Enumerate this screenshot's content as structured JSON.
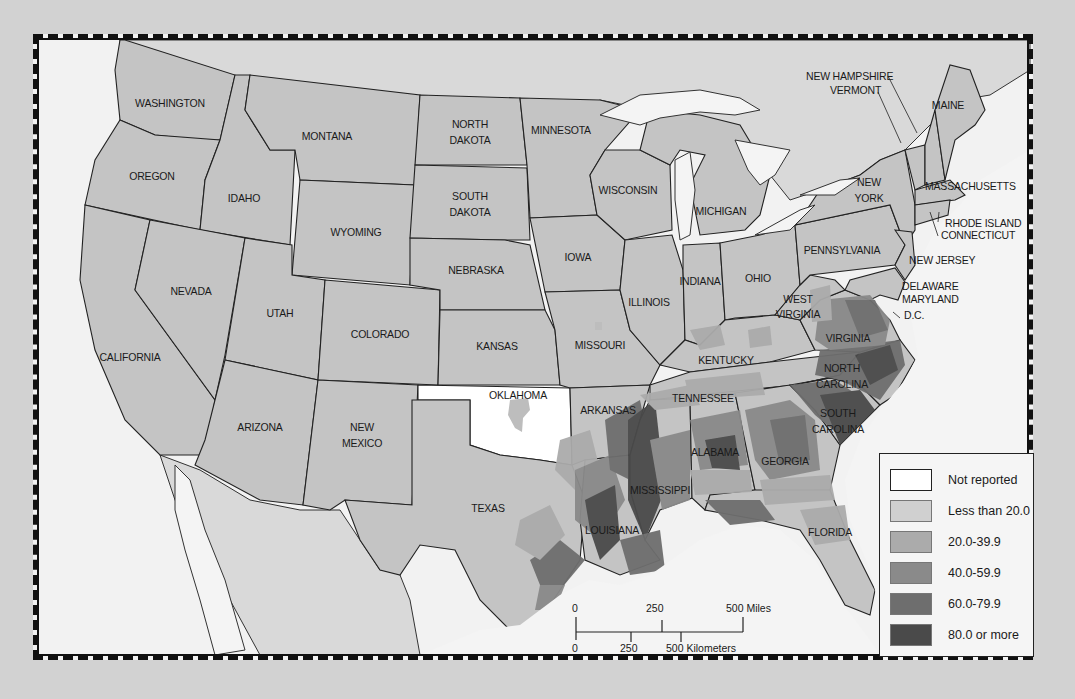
{
  "map": {
    "title": "",
    "states": {
      "washington": "WASHINGTON",
      "oregon": "OREGON",
      "california": "CALIFORNIA",
      "idaho": "IDAHO",
      "nevada": "NEVADA",
      "montana": "MONTANA",
      "wyoming": "WYOMING",
      "utah": "UTAH",
      "arizona": "ARIZONA",
      "colorado": "COLORADO",
      "new_mexico_1": "NEW",
      "new_mexico_2": "MEXICO",
      "north_dakota_1": "NORTH",
      "north_dakota_2": "DAKOTA",
      "south_dakota_1": "SOUTH",
      "south_dakota_2": "DAKOTA",
      "nebraska": "NEBRASKA",
      "kansas": "KANSAS",
      "oklahoma": "OKLAHOMA",
      "texas": "TEXAS",
      "minnesota": "MINNESOTA",
      "iowa": "IOWA",
      "missouri": "MISSOURI",
      "arkansas": "ARKANSAS",
      "louisiana": "LOUISIANA",
      "wisconsin": "WISCONSIN",
      "illinois": "ILLINOIS",
      "michigan": "MICHIGAN",
      "indiana": "INDIANA",
      "ohio": "OHIO",
      "kentucky": "KENTUCKY",
      "tennessee": "TENNESSEE",
      "mississippi": "MISSISSIPPI",
      "alabama": "ALABAMA",
      "georgia": "GEORGIA",
      "florida": "FLORIDA",
      "south_carolina_1": "SOUTH",
      "south_carolina_2": "CAROLINA",
      "north_carolina_1": "NORTH",
      "north_carolina_2": "CAROLINA",
      "virginia": "VIRGINIA",
      "west_virginia_1": "WEST",
      "west_virginia_2": "VIRGINIA",
      "pennsylvania": "PENNSYLVANIA",
      "new_york_1": "NEW",
      "new_york_2": "YORK",
      "maine": "MAINE",
      "new_hampshire": "NEW HAMPSHIRE",
      "vermont": "VERMONT",
      "massachusetts": "MASSACHUSETTS",
      "rhode_island": "RHODE ISLAND",
      "connecticut": "CONNECTICUT",
      "new_jersey": "NEW JERSEY",
      "delaware": "DELAWARE",
      "maryland": "MARYLAND",
      "dc": "D.C."
    },
    "not_reported_states": [
      "OKLAHOMA"
    ]
  },
  "legend": {
    "items": [
      {
        "label": "Not reported",
        "color": "#ffffff"
      },
      {
        "label": "Less than 20.0",
        "color": "#d0d0d0"
      },
      {
        "label": "20.0-39.9",
        "color": "#ababab"
      },
      {
        "label": "40.0-59.9",
        "color": "#8a8a8a"
      },
      {
        "label": "60.0-79.9",
        "color": "#6e6e6e"
      },
      {
        "label": "80.0 or more",
        "color": "#4a4a4a"
      }
    ]
  },
  "scale_bar": {
    "miles": {
      "ticks": [
        "0",
        "250",
        "500 Miles"
      ]
    },
    "kilometers": {
      "ticks": [
        "0",
        "250",
        "500 Kilometers"
      ]
    }
  },
  "colors": {
    "background": "#d2d2d2",
    "map_paper": "#f2f2f2",
    "state_fill": "#c4c4c4",
    "border": "#111111"
  }
}
